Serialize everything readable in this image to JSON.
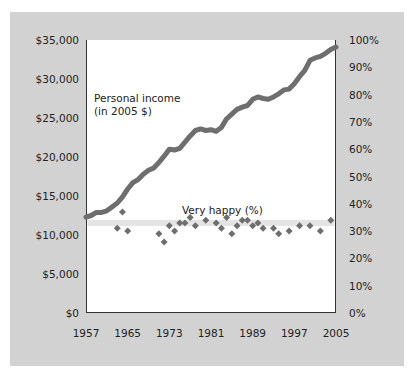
{
  "chart_data": {
    "type": "line",
    "title": "",
    "xlabel": "",
    "ylabel_left": "Personal income (in 2005 $)",
    "ylabel_right": "Very happy (%)",
    "x_ticks": [
      "1957",
      "1965",
      "1973",
      "1981",
      "1989",
      "1997",
      "2005"
    ],
    "y_left_ticks": [
      "$0",
      "$5,000",
      "$10,000",
      "$15,000",
      "$20,000",
      "$25,000",
      "$30,000",
      "$35,000"
    ],
    "y_right_ticks": [
      "0%",
      "10%",
      "20%",
      "30%",
      "40%",
      "50%",
      "60%",
      "70%",
      "80%",
      "90%",
      "100%"
    ],
    "xlim": [
      1957,
      2005
    ],
    "ylim_left": [
      0,
      35000
    ],
    "ylim_right": [
      0,
      100
    ],
    "grid": false,
    "annotations": [
      {
        "text_line1": "Personal income",
        "text_line2": "(in 2005 $)"
      },
      {
        "text": "Very happy (%)"
      }
    ],
    "series": [
      {
        "name": "Personal income (in 2005 $)",
        "type": "line",
        "axis": "left",
        "color": "#6e6e6e",
        "x": [
          1957,
          1958,
          1959,
          1960,
          1961,
          1962,
          1963,
          1964,
          1965,
          1966,
          1967,
          1968,
          1969,
          1970,
          1971,
          1972,
          1973,
          1974,
          1975,
          1976,
          1977,
          1978,
          1979,
          1980,
          1981,
          1982,
          1983,
          1984,
          1985,
          1986,
          1987,
          1988,
          1989,
          1990,
          1991,
          1992,
          1993,
          1994,
          1995,
          1996,
          1997,
          1998,
          1999,
          2000,
          2001,
          2002,
          2003,
          2004,
          2005
        ],
        "values": [
          12300,
          12500,
          12900,
          12900,
          13100,
          13600,
          14100,
          14900,
          15900,
          16700,
          17100,
          17800,
          18300,
          18600,
          19300,
          20100,
          21000,
          20900,
          21100,
          21900,
          22700,
          23400,
          23600,
          23400,
          23500,
          23300,
          23800,
          24900,
          25500,
          26100,
          26400,
          26600,
          27400,
          27700,
          27500,
          27400,
          27700,
          28100,
          28600,
          28700,
          29400,
          30300,
          31100,
          32400,
          32700,
          32900,
          33300,
          33800,
          34100
        ]
      },
      {
        "name": "Very happy (%)",
        "type": "scatter",
        "axis": "right",
        "color": "#6e6e6e",
        "x": [
          1963,
          1964,
          1965,
          1971,
          1972,
          1973,
          1974,
          1975,
          1976,
          1977,
          1978,
          1980,
          1982,
          1983,
          1984,
          1985,
          1986,
          1987,
          1988,
          1989,
          1990,
          1991,
          1993,
          1994,
          1996,
          1998,
          2000,
          2002,
          2004
        ],
        "values": [
          31,
          37,
          30,
          29,
          26,
          32,
          30,
          33,
          33,
          35,
          32,
          34,
          33,
          31,
          35,
          29,
          32,
          34,
          34,
          32,
          33,
          31,
          31,
          29,
          30,
          32,
          32,
          30,
          34
        ]
      },
      {
        "name": "Very happy reference band",
        "type": "hline",
        "axis": "right",
        "color": "#e4e4e4",
        "value": 33
      }
    ]
  },
  "labels": {
    "income_line1": "Personal income",
    "income_line2": "(in 2005 $)",
    "happy": "Very happy (%)"
  },
  "axes": {
    "left": [
      "$35,000",
      "$30,000",
      "$25,000",
      "$20,000",
      "$15,000",
      "$10,000",
      "$5,000",
      "$0"
    ],
    "right": [
      "100%",
      "90%",
      "80%",
      "70%",
      "60%",
      "50%",
      "40%",
      "30%",
      "20%",
      "10%",
      "0%"
    ],
    "bottom": [
      "1957",
      "1965",
      "1973",
      "1981",
      "1989",
      "1997",
      "2005"
    ]
  }
}
